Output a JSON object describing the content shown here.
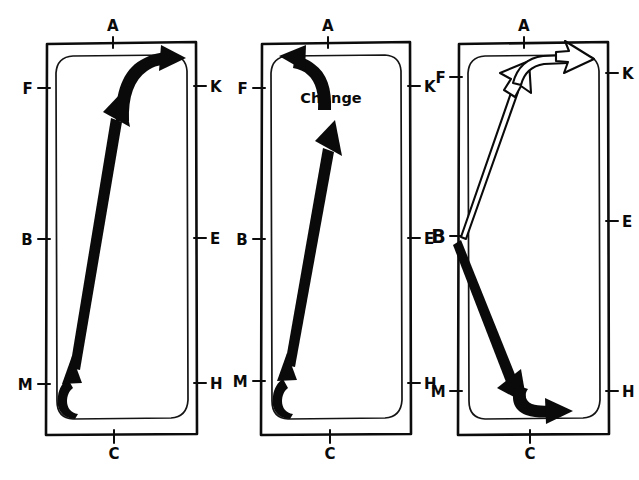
{
  "figure": {
    "type": "hand-drawn flow diagram",
    "panel_count": 3,
    "stroke_color": "#0a0a0a",
    "background_color": "#ffffff"
  },
  "panels": [
    {
      "id": "panel-1",
      "labels": {
        "top": "A",
        "bottom": "C",
        "left_upper": "F",
        "left_middle": "B",
        "left_lower": "M",
        "right_upper": "K",
        "right_middle": "E",
        "right_lower": "H"
      },
      "annotation": "",
      "arrows": [
        {
          "name": "bottom-hook-arrow",
          "style": "solid",
          "direction": "up",
          "from": "C",
          "to": "M"
        },
        {
          "name": "diagonal-arrow",
          "style": "solid",
          "direction": "up-right",
          "from": "M",
          "to": "A"
        },
        {
          "name": "top-hook-arrow",
          "style": "solid",
          "direction": "right",
          "from": "A",
          "to": "K"
        }
      ]
    },
    {
      "id": "panel-2",
      "labels": {
        "top": "A",
        "bottom": "C",
        "left_upper": "F",
        "left_middle": "B",
        "left_lower": "M",
        "right_upper": "K",
        "right_middle": "E",
        "right_lower": "H"
      },
      "annotation": "Change",
      "arrows": [
        {
          "name": "bottom-hook-arrow",
          "style": "solid",
          "direction": "up",
          "from": "C",
          "to": "M"
        },
        {
          "name": "diagonal-arrow",
          "style": "solid",
          "direction": "up-right",
          "from": "M",
          "to": "A"
        },
        {
          "name": "top-hook-arrow",
          "style": "solid",
          "direction": "left",
          "from": "A",
          "to": "F"
        }
      ]
    },
    {
      "id": "panel-3",
      "labels": {
        "top": "A",
        "bottom": "C",
        "left_upper": "F",
        "left_middle": "B",
        "left_lower": "M",
        "right_upper": "K",
        "right_middle": "E",
        "right_lower": "H"
      },
      "annotation": "",
      "arrows": [
        {
          "name": "diagonal-arrow-up",
          "style": "hollow",
          "direction": "up-right",
          "from": "B",
          "to": "A"
        },
        {
          "name": "top-hook-arrow",
          "style": "hollow",
          "direction": "right",
          "from": "A",
          "to": "K"
        },
        {
          "name": "diagonal-arrow-down",
          "style": "solid",
          "direction": "down-right",
          "from": "B",
          "to": "C"
        },
        {
          "name": "bottom-hook-arrow",
          "style": "solid",
          "direction": "right",
          "from": "C",
          "to": "H"
        }
      ]
    }
  ]
}
